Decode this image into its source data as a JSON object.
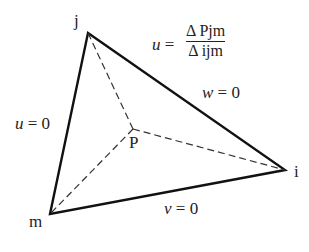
{
  "vertices": {
    "j": "j",
    "i": "i",
    "m": "m",
    "p": "P"
  },
  "edge_labels": {
    "jm": {
      "var": "u",
      "eq": " = 0"
    },
    "ji": {
      "var": "w",
      "eq": " = 0"
    },
    "mi": {
      "var": "v",
      "eq": " = 0"
    }
  },
  "formula": {
    "lhs": "u",
    "eq": " = ",
    "numerator": "Δ Pjm",
    "denominator": "Δ ijm"
  },
  "colors": {
    "stroke": "#111111",
    "text": "#222222"
  }
}
